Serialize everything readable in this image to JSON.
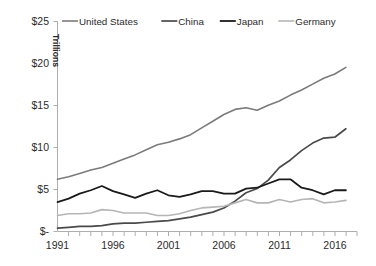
{
  "chart_data": {
    "type": "line",
    "title": "",
    "subtitle": "",
    "xlabel": "",
    "ylabel": "Trillions",
    "ylabel_display": "Trillions",
    "xlim": [
      1991,
      2018
    ],
    "ylim": [
      0,
      25
    ],
    "grid": false,
    "legend_position": "top",
    "y_ticks": [
      0,
      5,
      10,
      15,
      20,
      25
    ],
    "y_tick_labels": [
      "$-",
      "$5",
      "$10",
      "$15",
      "$20",
      "$25"
    ],
    "x_ticks": [
      1991,
      1996,
      2001,
      2006,
      2011,
      2016
    ],
    "x_tick_labels": [
      "1991",
      "1996",
      "2001",
      "2006",
      "2011",
      "2016"
    ],
    "x_minor_tick_interval": 1,
    "x": [
      1991,
      1992,
      1993,
      1994,
      1995,
      1996,
      1997,
      1998,
      1999,
      2000,
      2001,
      2002,
      2003,
      2004,
      2005,
      2006,
      2007,
      2008,
      2009,
      2010,
      2011,
      2012,
      2013,
      2014,
      2015,
      2016,
      2017
    ],
    "series": [
      {
        "name": "United States",
        "color": "#7b7b7b",
        "width": 1.6,
        "values": [
          6.2,
          6.5,
          6.9,
          7.3,
          7.6,
          8.1,
          8.6,
          9.1,
          9.7,
          10.3,
          10.6,
          11.0,
          11.5,
          12.3,
          13.1,
          13.9,
          14.5,
          14.7,
          14.4,
          15.0,
          15.5,
          16.2,
          16.8,
          17.5,
          18.2,
          18.7,
          19.5
        ]
      },
      {
        "name": "China",
        "color": "#4a4a4a",
        "width": 1.7,
        "values": [
          0.4,
          0.5,
          0.6,
          0.6,
          0.7,
          0.9,
          1.0,
          1.0,
          1.1,
          1.2,
          1.3,
          1.5,
          1.7,
          2.0,
          2.3,
          2.8,
          3.6,
          4.6,
          5.1,
          6.1,
          7.6,
          8.5,
          9.6,
          10.5,
          11.1,
          11.2,
          12.2
        ]
      },
      {
        "name": "Japan",
        "color": "#1a1a1a",
        "width": 1.8,
        "values": [
          3.5,
          3.9,
          4.5,
          4.9,
          5.4,
          4.8,
          4.4,
          4.0,
          4.5,
          4.9,
          4.3,
          4.1,
          4.4,
          4.8,
          4.8,
          4.5,
          4.5,
          5.1,
          5.2,
          5.7,
          6.2,
          6.2,
          5.2,
          4.9,
          4.4,
          4.9,
          4.9
        ]
      },
      {
        "name": "Germany",
        "color": "#b5b5b5",
        "width": 1.6,
        "values": [
          1.9,
          2.1,
          2.1,
          2.2,
          2.6,
          2.5,
          2.2,
          2.2,
          2.2,
          1.9,
          1.9,
          2.1,
          2.5,
          2.8,
          2.9,
          3.0,
          3.4,
          3.8,
          3.4,
          3.4,
          3.8,
          3.5,
          3.8,
          3.9,
          3.4,
          3.5,
          3.7
        ]
      }
    ],
    "legend": [
      {
        "label": "United States",
        "color": "#7b7b7b"
      },
      {
        "label": "China",
        "color": "#4a4a4a"
      },
      {
        "label": "Japan",
        "color": "#1a1a1a"
      },
      {
        "label": "Germany",
        "color": "#b5b5b5"
      }
    ],
    "axis_color": "#aeaeae",
    "background_color": "#ffffff"
  },
  "legend": {
    "items": [
      {
        "label": "United States"
      },
      {
        "label": "China"
      },
      {
        "label": "Japan"
      },
      {
        "label": "Germany"
      }
    ]
  },
  "axes": {
    "y_title": "Trillions",
    "y_labels": [
      "$25",
      "$20",
      "$15",
      "$10",
      "$5",
      "$-"
    ],
    "x_labels": [
      "1991",
      "1996",
      "2001",
      "2006",
      "2011",
      "2016"
    ]
  }
}
